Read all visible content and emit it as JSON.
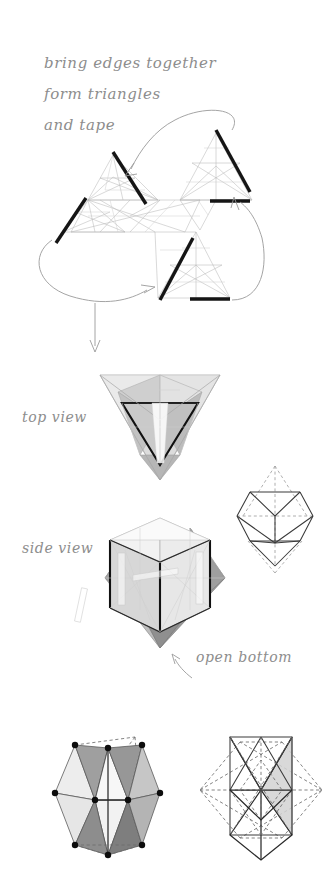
{
  "document": {
    "title": "Paper Model Folding Instructions",
    "background_color": "#ffffff",
    "ink_color": "#8d8d8d",
    "bold_edge_color": "#151515"
  },
  "annotations": {
    "instruction_line_1": "bring edges together",
    "instruction_line_2": "form triangles",
    "instruction_line_3": "and tape",
    "label_top_view": "top view",
    "label_side_view": "side view",
    "label_open_bottom": "open bottom"
  },
  "figures": {
    "net": {
      "name": "pinwheel-net",
      "description": "Flat paper net of three triangular units around a center, with bold edges to be taped",
      "bold_edge_count": 6
    },
    "top_view": {
      "name": "top-view-solid",
      "description": "Shaded tetrahedral solid seen from above with bold inner triangle"
    },
    "side_view": {
      "name": "side-view-solid",
      "description": "Shaded polyhedron seen from the side with translucent tape strips"
    },
    "wireframe_small": {
      "name": "wireframe-octahedron",
      "description": "Small wireframe with dashed apex extensions above and below"
    },
    "shaded_polyhedron": {
      "name": "shaded-polyhedron-vertices",
      "description": "Shaded polyhedron with black vertex dots and dashed hidden edges"
    },
    "wireframe_hexagon": {
      "name": "wireframe-with-hexagon-outline",
      "description": "Solid inner polyhedron inside a dashed hexagonal outline"
    }
  }
}
